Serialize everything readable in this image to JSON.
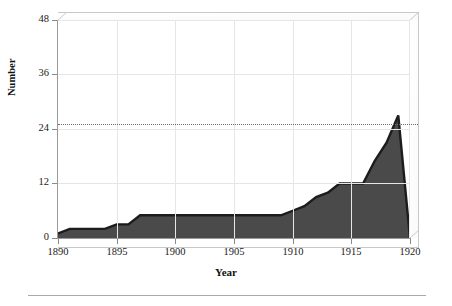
{
  "chart_data": {
    "type": "area",
    "title": "",
    "xlabel": "Year",
    "ylabel": "Number",
    "xlim": [
      1890,
      1920
    ],
    "ylim": [
      0,
      48
    ],
    "yticks": [
      0,
      12,
      24,
      36,
      48
    ],
    "xticks": [
      1890,
      1895,
      1900,
      1905,
      1910,
      1915,
      1920
    ],
    "grid": true,
    "legend": null,
    "fill_color": "#4a4a4a",
    "line_color": "#1c1c1c",
    "grid_color": "#e6e6e6",
    "axis_color": "#9a9a9a",
    "reference_line": {
      "value": 25,
      "style": "dotted",
      "color": "#6b6b6b"
    },
    "x": [
      1890,
      1891,
      1892,
      1893,
      1894,
      1895,
      1896,
      1897,
      1898,
      1899,
      1900,
      1901,
      1902,
      1903,
      1904,
      1905,
      1906,
      1907,
      1908,
      1909,
      1910,
      1911,
      1912,
      1913,
      1914,
      1915,
      1916,
      1917,
      1918,
      1919,
      1920
    ],
    "values": [
      1,
      2,
      2,
      2,
      2,
      3,
      3,
      5,
      5,
      5,
      5,
      5,
      5,
      5,
      5,
      5,
      5,
      5,
      5,
      5,
      6,
      7,
      9,
      10,
      12,
      12,
      12,
      17,
      21,
      27,
      0
    ],
    "series": [
      {
        "name": "Number",
        "values": [
          1,
          2,
          2,
          2,
          2,
          3,
          3,
          5,
          5,
          5,
          5,
          5,
          5,
          5,
          5,
          5,
          5,
          5,
          5,
          5,
          6,
          7,
          9,
          10,
          12,
          12,
          12,
          17,
          21,
          27,
          0
        ]
      }
    ]
  },
  "axis": {
    "ytick_labels": [
      "0",
      "12",
      "24",
      "36",
      "48"
    ],
    "xtick_labels": [
      "1890",
      "1895",
      "1900",
      "1905",
      "1910",
      "1915",
      "1920"
    ],
    "ylabel": "Number",
    "xlabel": "Year"
  }
}
